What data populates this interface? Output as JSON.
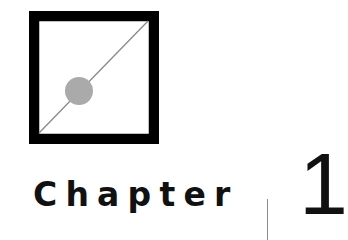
{
  "heading": {
    "label": "Chapter",
    "number": "1"
  },
  "emblem": {
    "icon": "square-diagonal-dot-icon",
    "frame_color": "#000000",
    "line_color": "#8a8a8a",
    "dot_color": "#aaaaaa"
  },
  "colors": {
    "text": "#111111",
    "divider": "#8a8a8a",
    "background": "#ffffff"
  }
}
